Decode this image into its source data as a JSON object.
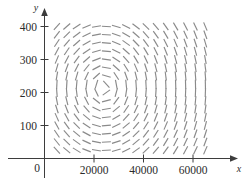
{
  "figure": {
    "title": "",
    "background_color": "#ffffff",
    "axis_color": "#3d3d3d",
    "field_color": "#8a8a8a"
  },
  "axes": {
    "x_axis_label": "x",
    "y_axis_label": "y",
    "origin_label": "0",
    "x_ticks": [
      {
        "value": 20000,
        "label": "20000"
      },
      {
        "value": 40000,
        "label": "40000"
      },
      {
        "value": 60000,
        "label": "60000"
      }
    ],
    "y_ticks": [
      {
        "value": 100,
        "label": "100"
      },
      {
        "value": 200,
        "label": "200"
      },
      {
        "value": 300,
        "label": "300"
      },
      {
        "value": 400,
        "label": "400"
      }
    ]
  },
  "chart_data": {
    "type": "scatter",
    "plot_kind": "direction-field",
    "title": "",
    "xlabel": "x",
    "ylabel": "y",
    "xlim": [
      0,
      68000
    ],
    "ylim": [
      0,
      430
    ],
    "grid": false,
    "legend": null,
    "equilibrium_center": {
      "x": 24000,
      "y": 215
    },
    "segment_length_px": 9,
    "grid_x_values": [
      5000,
      9000,
      13000,
      17000,
      21000,
      25000,
      29000,
      33000,
      37000,
      41000,
      45000,
      49000,
      53000,
      57000,
      61000,
      65000
    ],
    "grid_y_values": [
      25,
      50,
      75,
      100,
      125,
      150,
      175,
      200,
      225,
      250,
      275,
      300,
      325,
      350,
      375,
      400
    ],
    "slope_model": {
      "form": "dy/dx = (c1*y*(x - x0)) / (c2*x*(y0 - y))",
      "x0": 24000,
      "y0": 215,
      "angle_scale_x": 24000,
      "angle_scale_y": 215
    }
  }
}
